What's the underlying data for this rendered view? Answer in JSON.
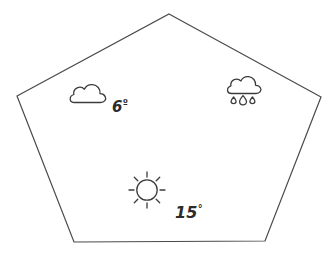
{
  "figure": {
    "name": "weather-pentagon-diagram",
    "shape": "pentagon",
    "stroke_color": "#4a4a4a",
    "fill_color": "#ffffff",
    "background_color": "#ffffff",
    "vertices": [
      {
        "x": 169,
        "y": 14
      },
      {
        "x": 321,
        "y": 97
      },
      {
        "x": 265,
        "y": 241
      },
      {
        "x": 74,
        "y": 242
      },
      {
        "x": 17,
        "y": 96
      }
    ]
  },
  "icons": {
    "cloud": {
      "name": "cloud-icon",
      "label": "cloud",
      "x": 88,
      "y": 93
    },
    "rain_cloud": {
      "name": "rain-cloud-icon",
      "label": "rain cloud",
      "x": 244,
      "y": 90,
      "droplets": 3
    },
    "sun": {
      "name": "sun-icon",
      "label": "sun",
      "x": 147,
      "y": 190,
      "rays": 8
    }
  },
  "readings": [
    {
      "id": "cloud-temperature",
      "icon": "cloud-icon",
      "value": "6",
      "unit": "°",
      "text": "6°"
    },
    {
      "id": "sun-temperature",
      "icon": "sun-icon",
      "value": "15",
      "unit": "°",
      "text": "15°"
    }
  ],
  "labels": {
    "cloud_temp_value": "6",
    "cloud_temp_unit": "º",
    "sun_temp_value": "15",
    "sun_temp_unit": "°"
  }
}
